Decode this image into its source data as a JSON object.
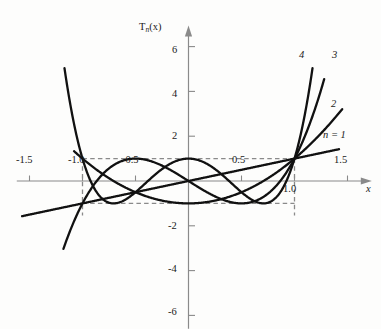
{
  "figure": {
    "background_color": "#fdfdfc",
    "ink_color": "#111111",
    "axis_color": "#8a8a8a",
    "dash_color": "#8a8a8a"
  },
  "axes": {
    "y_axis_title": "T",
    "y_axis_title_sub": "n",
    "y_axis_title_tail": "(x)",
    "x_axis_title": "x",
    "x_tick_labels": [
      "-1.5",
      "-1.0",
      "-0.5",
      "0.5",
      "1.0",
      "1.5"
    ],
    "y_tick_labels": [
      "6",
      "4",
      "2",
      "-2",
      "-4",
      "-6"
    ]
  },
  "curve_labels": {
    "n4": "4",
    "n3": "3",
    "n2": "2",
    "n1_prefix": "n",
    "n1_eq": "=",
    "n1_value": "1",
    "n1_full": "n = 1"
  },
  "chart_data": {
    "type": "line",
    "title": "",
    "xlabel": "x",
    "ylabel": "T_n(x)",
    "xlim": [
      -1.62,
      1.72
    ],
    "ylim": [
      -6.6,
      6.9
    ],
    "grid": false,
    "legend": "inline-curve-end-labels",
    "x_ticks": [
      -1.5,
      -1.0,
      -0.5,
      0.5,
      1.0,
      1.5
    ],
    "y_ticks": [
      6,
      4,
      2,
      -2,
      -4,
      -6
    ],
    "annotations": [
      {
        "text": "dashed reference box",
        "x_range": [
          -1.0,
          1.0
        ],
        "y_range": [
          -1.0,
          1.0
        ],
        "style": "dashed"
      }
    ],
    "series": [
      {
        "name": "n = 1",
        "label": "n = 1",
        "formula": "T1(x) = x",
        "coeffs": [
          0,
          1
        ],
        "x_start": -1.57,
        "x_end": 1.42,
        "points": [
          {
            "x": -1.57,
            "y": -1.57
          },
          {
            "x": -1.0,
            "y": -1.0
          },
          {
            "x": -0.5,
            "y": -0.5
          },
          {
            "x": 0.0,
            "y": 0.0
          },
          {
            "x": 0.5,
            "y": 0.5
          },
          {
            "x": 1.0,
            "y": 1.0
          },
          {
            "x": 1.42,
            "y": 1.42
          }
        ]
      },
      {
        "name": "2",
        "label": "2",
        "formula": "T2(x) = 2x^2 - 1",
        "coeffs": [
          -1,
          0,
          2
        ],
        "x_start": -1.08,
        "x_end": 1.45,
        "points": [
          {
            "x": -1.08,
            "y": 1.33
          },
          {
            "x": -1.0,
            "y": 1.0
          },
          {
            "x": -0.5,
            "y": -0.5
          },
          {
            "x": 0.0,
            "y": -1.0
          },
          {
            "x": 0.5,
            "y": -0.5
          },
          {
            "x": 1.0,
            "y": 1.0
          },
          {
            "x": 1.45,
            "y": 3.21
          }
        ]
      },
      {
        "name": "3",
        "label": "3",
        "formula": "T3(x) = 4x^3 - 3x",
        "coeffs": [
          0,
          -3,
          0,
          4
        ],
        "x_start": -1.18,
        "x_end": 1.28,
        "points": [
          {
            "x": -1.18,
            "y": -3.03
          },
          {
            "x": -1.0,
            "y": -1.0
          },
          {
            "x": -0.866,
            "y": 0.0
          },
          {
            "x": -0.5,
            "y": 1.0
          },
          {
            "x": 0.0,
            "y": 0.0
          },
          {
            "x": 0.5,
            "y": -1.0
          },
          {
            "x": 0.866,
            "y": 0.0
          },
          {
            "x": 1.0,
            "y": 1.0
          },
          {
            "x": 1.28,
            "y": 4.55
          }
        ]
      },
      {
        "name": "4",
        "label": "4",
        "formula": "T4(x) = 8x^4 - 8x^2 + 1",
        "coeffs": [
          1,
          0,
          -8,
          0,
          8
        ],
        "x_start": -1.17,
        "x_end": 1.17,
        "points": [
          {
            "x": -1.17,
            "y": 5.96
          },
          {
            "x": -1.0,
            "y": 1.0
          },
          {
            "x": -0.924,
            "y": 0.0
          },
          {
            "x": -0.707,
            "y": -1.0
          },
          {
            "x": -0.383,
            "y": 0.0
          },
          {
            "x": 0.0,
            "y": 1.0
          },
          {
            "x": 0.383,
            "y": 0.0
          },
          {
            "x": 0.707,
            "y": -1.0
          },
          {
            "x": 0.924,
            "y": 0.0
          },
          {
            "x": 1.0,
            "y": 1.0
          },
          {
            "x": 1.17,
            "y": 5.96
          }
        ]
      }
    ]
  }
}
